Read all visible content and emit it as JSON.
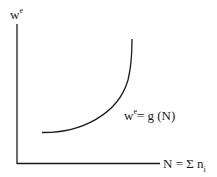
{
  "diagram": {
    "y_axis_label": {
      "base": "w",
      "sup": "e"
    },
    "x_axis_label": {
      "base": "N = Σ n",
      "sub": "i"
    },
    "curve_label": {
      "base1": "w",
      "sup": "e",
      "rest": "= g (N)"
    },
    "colors": {
      "line": "#1a1a1a",
      "background": "#ffffff"
    },
    "curve": {
      "type": "convex increasing",
      "start": [
        42,
        132
      ],
      "end": [
        132,
        39
      ]
    }
  }
}
